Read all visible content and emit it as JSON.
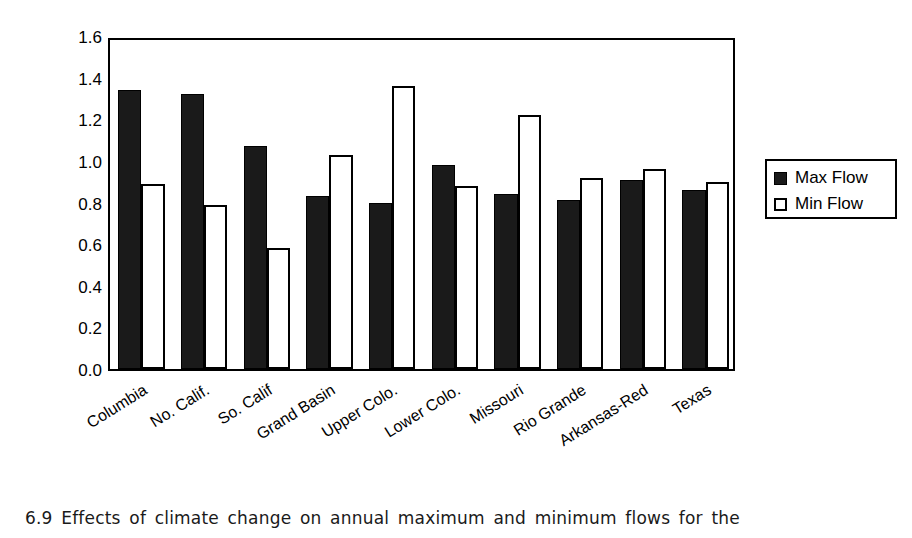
{
  "chart_data": {
    "type": "bar",
    "title": "",
    "xlabel": "",
    "ylabel": "GISS/Current",
    "ylim": [
      0.0,
      1.6
    ],
    "ytick_step": 0.2,
    "yticks": [
      "1.6",
      "1.4",
      "1.2",
      "1.0",
      "0.8",
      "0.6",
      "0.4",
      "0.2",
      "0.0"
    ],
    "grid": false,
    "legend_position": "right",
    "categories": [
      "Columbia",
      "No. Calif.",
      "So. Calif",
      "Grand Basin",
      "Upper Colo.",
      "Lower Colo.",
      "Missouri",
      "Rio Grande",
      "Arkansas-Red",
      "Texas"
    ],
    "series": [
      {
        "name": "Max Flow",
        "color": "#1a1a1a",
        "fill": "solid",
        "values": [
          1.34,
          1.32,
          1.07,
          0.83,
          0.8,
          0.98,
          0.84,
          0.81,
          0.91,
          0.86
        ]
      },
      {
        "name": "Min Flow",
        "color": "#ffffff",
        "fill": "hollow",
        "values": [
          0.89,
          0.79,
          0.58,
          1.03,
          1.36,
          0.88,
          1.22,
          0.92,
          0.96,
          0.9
        ]
      }
    ]
  },
  "legend": {
    "entries": [
      {
        "label": "Max Flow",
        "swatch": "filled-square-icon"
      },
      {
        "label": "Min Flow",
        "swatch": "hollow-square-icon"
      }
    ]
  },
  "caption": {
    "text": "6.9 Effects of climate change on annual maximum and minimum flows for the"
  },
  "colors": {
    "max_flow": "#1a1a1a",
    "min_flow": "#ffffff",
    "axis": "#000000",
    "background": "#ffffff"
  }
}
